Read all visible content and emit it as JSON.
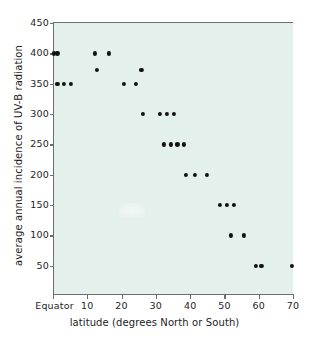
{
  "chart_data": {
    "type": "scatter",
    "title": "",
    "xlabel": "latitude (degrees North or South)",
    "ylabel": "average annual incidence of UV-B radiation",
    "xlim": [
      0,
      70
    ],
    "ylim": [
      0,
      450
    ],
    "grid": false,
    "legend": null,
    "x_tick_labels": [
      "Equator",
      "10",
      "20",
      "30",
      "40",
      "50",
      "60",
      "70"
    ],
    "x_tick_values": [
      0,
      10,
      20,
      30,
      40,
      50,
      60,
      70
    ],
    "y_tick_labels": [
      "50",
      "100",
      "150",
      "200",
      "250",
      "300",
      "350",
      "400",
      "450"
    ],
    "y_tick_values": [
      50,
      100,
      150,
      200,
      250,
      300,
      350,
      400,
      450
    ],
    "marker": "filled-circle",
    "marker_color": "#121212",
    "plot_background": "#e4f0ec",
    "points": [
      {
        "x": 0.0,
        "y": 400
      },
      {
        "x": 1.0,
        "y": 400
      },
      {
        "x": 12.0,
        "y": 400
      },
      {
        "x": 16.0,
        "y": 400
      },
      {
        "x": 12.5,
        "y": 373
      },
      {
        "x": 25.5,
        "y": 373
      },
      {
        "x": 1.0,
        "y": 350
      },
      {
        "x": 3.0,
        "y": 350
      },
      {
        "x": 5.0,
        "y": 350
      },
      {
        "x": 20.5,
        "y": 350
      },
      {
        "x": 24.0,
        "y": 350
      },
      {
        "x": 26.0,
        "y": 300
      },
      {
        "x": 31.0,
        "y": 300
      },
      {
        "x": 33.0,
        "y": 300
      },
      {
        "x": 35.0,
        "y": 300
      },
      {
        "x": 32.0,
        "y": 250
      },
      {
        "x": 34.0,
        "y": 250
      },
      {
        "x": 36.0,
        "y": 250
      },
      {
        "x": 38.0,
        "y": 250
      },
      {
        "x": 38.5,
        "y": 200
      },
      {
        "x": 41.0,
        "y": 200
      },
      {
        "x": 44.5,
        "y": 200
      },
      {
        "x": 48.5,
        "y": 150
      },
      {
        "x": 50.5,
        "y": 150
      },
      {
        "x": 52.5,
        "y": 150
      },
      {
        "x": 51.5,
        "y": 100
      },
      {
        "x": 55.5,
        "y": 100
      },
      {
        "x": 59.0,
        "y": 50
      },
      {
        "x": 60.5,
        "y": 50
      },
      {
        "x": 69.5,
        "y": 50
      }
    ]
  }
}
